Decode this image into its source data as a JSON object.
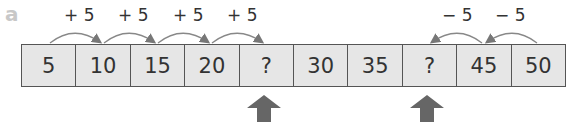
{
  "exercise_label": "a",
  "cells": [
    "5",
    "10",
    "15",
    "20",
    "?",
    "30",
    "35",
    "?",
    "45",
    "50"
  ],
  "forward_hops": [
    {
      "label": "+ 5",
      "from": 0,
      "to": 1
    },
    {
      "label": "+ 5",
      "from": 1,
      "to": 2
    },
    {
      "label": "+ 5",
      "from": 2,
      "to": 3
    },
    {
      "label": "+ 5",
      "from": 3,
      "to": 4
    }
  ],
  "backward_hops": [
    {
      "label": "− 5",
      "from": 8,
      "to": 7
    },
    {
      "label": "− 5",
      "from": 9,
      "to": 8
    }
  ],
  "pointer_arrows": [
    {
      "target_cell": 4
    },
    {
      "target_cell": 7
    }
  ],
  "colors": {
    "cell_fill": "#e6e6e6",
    "border": "#555555",
    "arrow": "#666666"
  }
}
